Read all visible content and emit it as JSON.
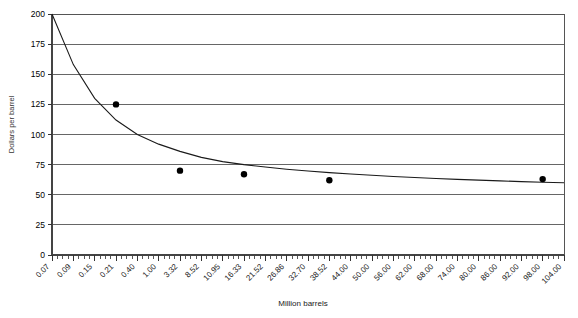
{
  "chart_data": {
    "type": "scatter",
    "title": "",
    "xlabel": "Million barrels",
    "ylabel": "Dollars per barrel",
    "ylim": [
      0,
      200
    ],
    "y_ticks": [
      0,
      25,
      50,
      75,
      100,
      125,
      150,
      175,
      200
    ],
    "y_tick_labels": [
      "0",
      "25",
      "50",
      "75",
      "100",
      "125",
      "150",
      "175",
      "200"
    ],
    "grid": true,
    "legend": "none",
    "x_categories": [
      "0.07",
      "0.09",
      "0.15",
      "0.21",
      "0.40",
      "1.00",
      "3.32",
      "8.52",
      "10.95",
      "16.33",
      "21.52",
      "26.86",
      "32.70",
      "38.52",
      "44.00",
      "50.00",
      "56.00",
      "62.00",
      "68.00",
      "74.00",
      "80.00",
      "86.00",
      "92.00",
      "98.00",
      "104.00"
    ],
    "points": [
      {
        "x_label": "0.21",
        "x_index": 3,
        "y": 125
      },
      {
        "x_label": "3.32",
        "x_index": 6,
        "y": 70
      },
      {
        "x_label": "16.33",
        "x_index": 9,
        "y": 67
      },
      {
        "x_label": "38.52",
        "x_index": 13,
        "y": 62
      },
      {
        "x_label": "98.00",
        "x_index": 23,
        "y": 63
      }
    ],
    "fitted_curve": {
      "description": "decreasing power-law trend line",
      "y_at_index": [
        200,
        158,
        130,
        112,
        100,
        92,
        86,
        81,
        77.5,
        75,
        73,
        71.2,
        69.7,
        68.4,
        67.2,
        66.2,
        65.2,
        64.3,
        63.5,
        62.8,
        62.1,
        61.5,
        60.9,
        60.4,
        59.9
      ]
    }
  }
}
